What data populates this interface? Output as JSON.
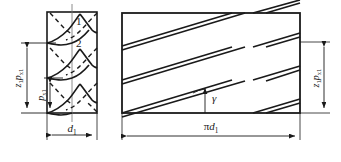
{
  "figure": {
    "name": "worm-lead-angle-diagram",
    "stroke_color": "#1a1a1a",
    "label_color": "#1a1a1a",
    "background": "#ffffff"
  },
  "left_view": {
    "name": "axial-section-view",
    "curve_labels": [
      {
        "text": "1"
      },
      {
        "text": "2"
      }
    ],
    "dim_outer": {
      "symbol": "z",
      "sub1": "1",
      "symbol2": "p",
      "sub2": "x1",
      "full_text": "z1px1"
    },
    "dim_inner": {
      "symbol": "p",
      "sub": "x1",
      "full_text": "px1"
    },
    "dim_width": {
      "symbol": "d",
      "sub": "1",
      "full_text": "d1"
    }
  },
  "right_view": {
    "name": "unrolled-development-view",
    "angle_label": {
      "symbol": "γ",
      "full_text": "gamma"
    },
    "dim_height": {
      "symbol": "z",
      "sub1": "1",
      "symbol2": "p",
      "sub2": "x1",
      "full_text": "z1px1"
    },
    "dim_width": {
      "prefix": "π",
      "symbol": "d",
      "sub": "1",
      "full_text": "pi*d1"
    }
  }
}
